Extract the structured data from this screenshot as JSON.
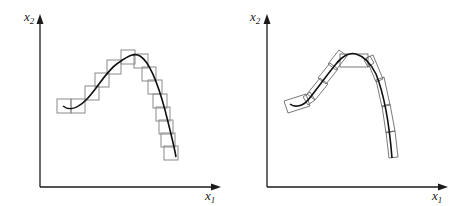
{
  "panels": [
    {
      "name": "axis-aligned-boxes",
      "x_label": "x",
      "x_sub": "1",
      "y_label": "x",
      "y_sub": "2"
    },
    {
      "name": "oriented-boxes",
      "x_label": "x",
      "x_sub": "1",
      "y_label": "x",
      "y_sub": "2"
    }
  ]
}
